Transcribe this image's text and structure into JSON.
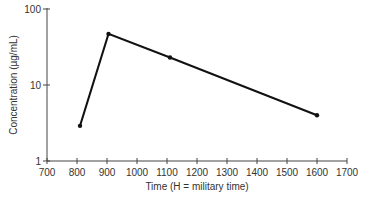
{
  "chart_data": {
    "type": "line",
    "title": "",
    "xlabel": "Time (H = military time)",
    "ylabel": "Concentration (µg/mL)",
    "xscale": "linear",
    "yscale": "log",
    "xlim": [
      700,
      1700
    ],
    "ylim": [
      1,
      100
    ],
    "xticks": [
      700,
      800,
      900,
      1000,
      1100,
      1200,
      1300,
      1400,
      1500,
      1600,
      1700
    ],
    "yticks": [
      1,
      10,
      100
    ],
    "grid": false,
    "legend": null,
    "series": [
      {
        "name": "Concentration",
        "x": [
          810,
          905,
          1110,
          1600
        ],
        "y": [
          2.9,
          47,
          23,
          4.0
        ],
        "marker": "circle",
        "color": "#111111"
      }
    ]
  },
  "colors": {
    "axis": "#444444",
    "line": "#111111",
    "text": "#333333"
  }
}
